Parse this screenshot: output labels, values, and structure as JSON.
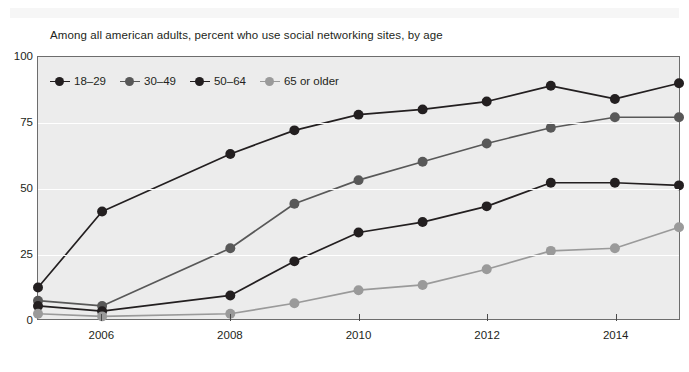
{
  "subtitle": "Among all american adults, percent who use social networking sites, by age",
  "legend": {
    "position": "top-left-inside",
    "items": [
      {
        "label": "18–29",
        "color": "#231f20"
      },
      {
        "label": "30–49",
        "color": "#585858"
      },
      {
        "label": "50–64",
        "color": "#231f20"
      },
      {
        "label": "65 or older",
        "color": "#9a9a9a"
      }
    ]
  },
  "axes": {
    "y_ticks": [
      0,
      25,
      50,
      75,
      100
    ],
    "x_ticks": [
      2006,
      2008,
      2010,
      2012,
      2014
    ]
  },
  "style": {
    "plot_background": "#ececec",
    "gridline_color": "#ffffff",
    "frame_color": "#6d6d6d",
    "text_color": "#231f20"
  },
  "chart_data": {
    "type": "line",
    "title": "",
    "subtitle": "Among all american adults, percent who use social networking sites, by age",
    "xlabel": "",
    "ylabel": "",
    "xlim": [
      2005,
      2015
    ],
    "ylim": [
      0,
      100
    ],
    "grid": true,
    "legend_position": "upper left",
    "x": [
      2005,
      2006,
      2008,
      2009,
      2010,
      2011,
      2012,
      2013,
      2014,
      2015
    ],
    "series": [
      {
        "name": "18–29",
        "color": "#231f20",
        "values": [
          12,
          41,
          63,
          72,
          78,
          80,
          83,
          89,
          84,
          90
        ]
      },
      {
        "name": "30–49",
        "color": "#585858",
        "values": [
          7,
          5,
          27,
          44,
          53,
          60,
          67,
          73,
          77,
          77
        ]
      },
      {
        "name": "50–64",
        "color": "#231f20",
        "values": [
          5,
          3,
          9,
          22,
          33,
          37,
          43,
          52,
          52,
          51
        ]
      },
      {
        "name": "65 or older",
        "color": "#9a9a9a",
        "values": [
          2,
          1,
          2,
          6,
          11,
          13,
          19,
          26,
          27,
          35
        ]
      }
    ]
  }
}
